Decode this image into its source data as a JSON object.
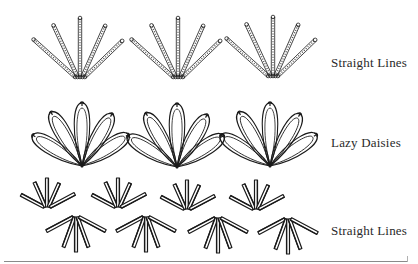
{
  "rows": [
    {
      "id": "straight-lines-top",
      "label": "Straight Lines",
      "stitch": "straight-line-dotted",
      "fans": [
        {
          "cx": 80,
          "cy": 77
        },
        {
          "cx": 178,
          "cy": 77
        },
        {
          "cx": 273,
          "cy": 76
        }
      ]
    },
    {
      "id": "lazy-daisies",
      "label": "Lazy Daisies",
      "stitch": "lazy-daisy",
      "fans": [
        {
          "cx": 82,
          "cy": 166
        },
        {
          "cx": 177,
          "cy": 167
        },
        {
          "cx": 270,
          "cy": 166
        }
      ]
    },
    {
      "id": "straight-lines-bottom",
      "label": "Straight Lines",
      "stitch": "straight-line-double",
      "upper_fans": [
        {
          "cx": 47,
          "cy": 207
        },
        {
          "cx": 118,
          "cy": 207
        },
        {
          "cx": 187,
          "cy": 209
        },
        {
          "cx": 256,
          "cy": 209
        }
      ],
      "lower_fans": [
        {
          "cx": 76,
          "cy": 217
        },
        {
          "cx": 146,
          "cy": 217
        },
        {
          "cx": 218,
          "cy": 218
        },
        {
          "cx": 288,
          "cy": 219
        }
      ]
    }
  ],
  "colors": {
    "ink": "#1a1a1a",
    "text": "#2a2a2a",
    "rule": "#8a8a8a",
    "background": "#ffffff"
  }
}
